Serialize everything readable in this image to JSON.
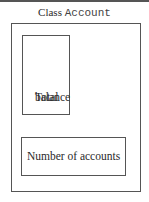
{
  "diagram": {
    "title_prefix": "Class",
    "title_class_name": "Account",
    "boxes": [
      {
        "label_line1": "Total",
        "label_line2": "balance"
      },
      {
        "label": "Number of accounts"
      }
    ]
  }
}
